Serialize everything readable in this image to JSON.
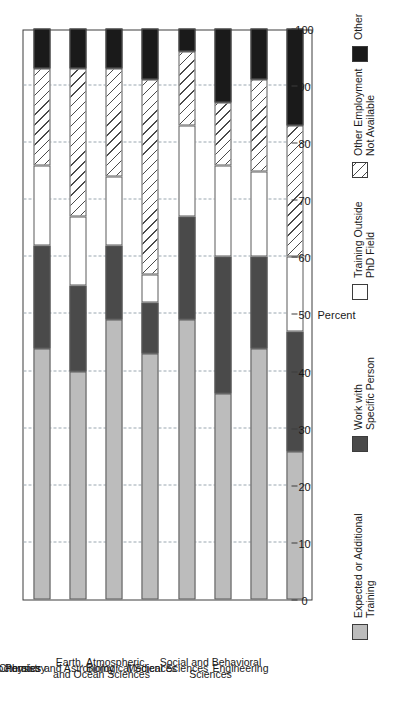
{
  "figure": {
    "orientation": "rotated-90",
    "axis_title": "Percent",
    "corner_mark": ""
  },
  "chart_data": {
    "type": "bar",
    "subtype": "stacked-horizontal-100",
    "title": "",
    "xlabel": "Percent",
    "ylabel": "",
    "xlim": [
      0,
      100
    ],
    "grid": true,
    "legend_position": "bottom",
    "tick_values": [
      0,
      10,
      20,
      30,
      40,
      50,
      60,
      70,
      80,
      90,
      100
    ],
    "tick_labels": [
      "0",
      "10",
      "20",
      "30",
      "40",
      "50",
      "60",
      "70",
      "80",
      "90",
      "100"
    ],
    "categories": [
      "All S&E Postdoctorates",
      "Chemistry",
      "Physics and Astronomy",
      "Earth, Atmospheric,\nand Ocean Sciences",
      "Biological Sciences",
      "Medical Sciences",
      "Social and Behavioral\nSciences",
      "Engineering"
    ],
    "series": [
      {
        "name": "Expected or Additional Training",
        "key": "expected",
        "color": "#bcbcbc",
        "values": [
          44,
          40,
          49,
          43,
          49,
          36,
          44,
          26
        ]
      },
      {
        "name": "Work with Specific Person",
        "key": "workwith",
        "color": "#4a4a4a",
        "values": [
          18,
          15,
          13,
          9,
          18,
          24,
          16,
          21
        ]
      },
      {
        "name": "Training Outside PhD Field",
        "key": "training",
        "color": "#ffffff",
        "values": [
          14,
          12,
          12,
          5,
          16,
          16,
          15,
          13
        ]
      },
      {
        "name": "Other Employment Not Available",
        "key": "other-emp",
        "color": "#ffffff",
        "hatch": "diagonal",
        "values": [
          17,
          26,
          19,
          34,
          13,
          11,
          16,
          23
        ]
      },
      {
        "name": "Other",
        "key": "other",
        "color": "#1a1a1a",
        "values": [
          7,
          7,
          7,
          9,
          4,
          13,
          9,
          17
        ]
      }
    ]
  },
  "legend": {
    "items": [
      {
        "label_line1": "Expected or Additional",
        "label_line2": "Training",
        "key": "expected"
      },
      {
        "label_line1": "Work with",
        "label_line2": "Specific Person",
        "key": "workwith"
      },
      {
        "label_line1": "Training Outside",
        "label_line2": "PhD Field",
        "key": "training"
      },
      {
        "label_line1": "Other Employment",
        "label_line2": "Not Available",
        "key": "other-emp"
      },
      {
        "label_line1": "Other",
        "label_line2": "",
        "key": "other"
      }
    ]
  }
}
